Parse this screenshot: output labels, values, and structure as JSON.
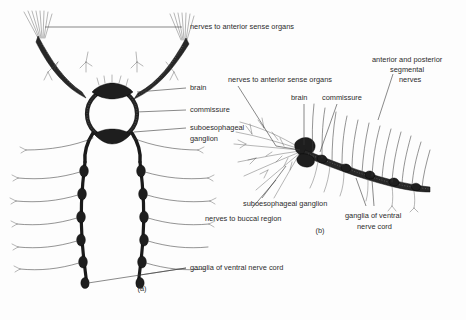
{
  "figure": {
    "background_color": "#fdfdfd",
    "ink_color": "#222222",
    "panel_a": {
      "caption": "(a)",
      "labels": {
        "nerves_anterior": "nerves to anterior sense organs",
        "brain": "brain",
        "commissure": "commissure",
        "suboesophageal_ganglion_line1": "suboesophageal",
        "suboesophageal_ganglion_line2": "ganglion",
        "ganglia_ventral_cord": "ganglia of ventral nerve cord"
      }
    },
    "panel_b": {
      "caption": "(b)",
      "labels": {
        "nerves_anterior": "nerves to anterior sense organs",
        "brain": "brain",
        "commissure": "commissure",
        "segmental_line1": "anterior and posterior",
        "segmental_line2": "segmental",
        "segmental_line3": "nerves",
        "suboesophageal_ganglion": "suboesophageal ganglion",
        "nerves_buccal": "nerves to buccal region",
        "ganglia_ventral_line1": "ganglia of ventral",
        "ganglia_ventral_line2": "nerve cord"
      }
    }
  }
}
